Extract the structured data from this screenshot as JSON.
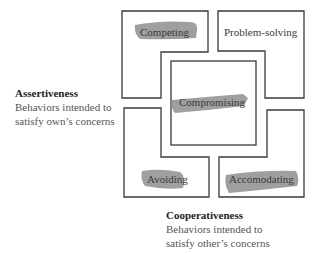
{
  "diagram": {
    "type": "Thomas-Kilmann conflict modes",
    "modes": [
      {
        "id": "competing",
        "label": "Competing",
        "highlighted": true
      },
      {
        "id": "problem-solving",
        "label": "Problem-solving",
        "highlighted": false
      },
      {
        "id": "compromising",
        "label": "Compromising",
        "highlighted": true
      },
      {
        "id": "avoiding",
        "label": "Avoiding",
        "highlighted": true
      },
      {
        "id": "accommodating",
        "label": "Accomodating",
        "highlighted": true
      }
    ],
    "y_axis": {
      "title": "Assertiveness",
      "line1": "Behaviors intended to",
      "line2": "satisfy own’s concerns"
    },
    "x_axis": {
      "title": "Cooperativeness",
      "line1": "Behaviors intended to",
      "line2": "satisfy other’s concerns"
    },
    "colors": {
      "line": "#3a3a3a",
      "highlight": "#8f8f8f",
      "background": "#ffffff"
    }
  }
}
